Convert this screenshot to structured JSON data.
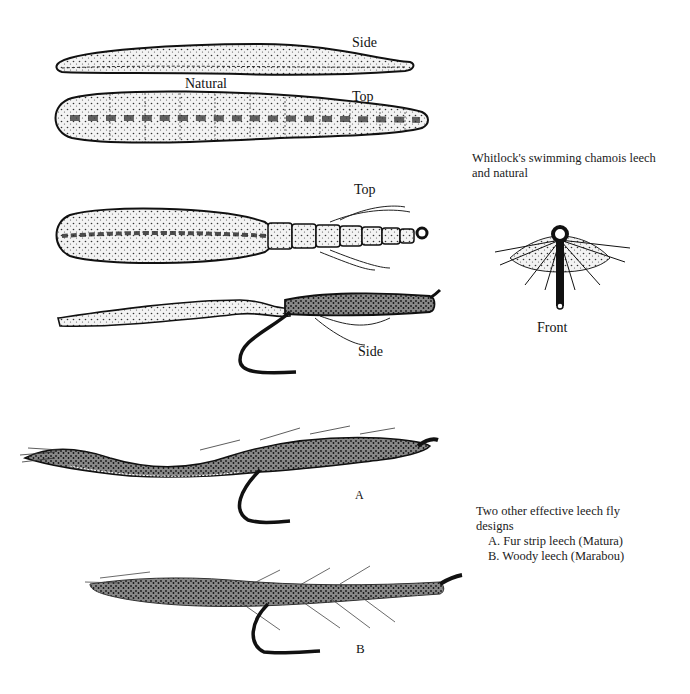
{
  "figure_1": {
    "caption": [
      "Whitlock's swimming chamois leech",
      "and natural"
    ],
    "natural": {
      "group_label": "Natural",
      "side_label": "Side",
      "top_label": "Top"
    },
    "fly": {
      "top_label": "Top",
      "side_label": "Side",
      "front_label": "Front"
    }
  },
  "figure_2": {
    "caption": [
      "Two other effective leech fly",
      "designs"
    ],
    "items": [
      {
        "letter": "A",
        "text": "A.  Fur strip leech (Matura)"
      },
      {
        "letter": "B",
        "text": "B.  Woody leech (Marabou)"
      }
    ]
  },
  "colors": {
    "ink": "#111111",
    "paper": "#ffffff",
    "shade": "#6a6a6a"
  }
}
